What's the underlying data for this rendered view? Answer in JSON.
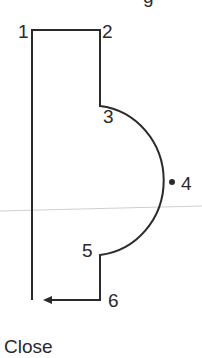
{
  "diagram": {
    "top_fragment": "g",
    "points": [
      {
        "id": "1",
        "label": "1"
      },
      {
        "id": "2",
        "label": "2"
      },
      {
        "id": "3",
        "label": "3"
      },
      {
        "id": "4",
        "label": "4"
      },
      {
        "id": "5",
        "label": "5"
      },
      {
        "id": "6",
        "label": "6"
      }
    ],
    "close_label": "Close",
    "colors": {
      "stroke": "#2a2a2a",
      "guide": "#cfcfcf"
    }
  }
}
